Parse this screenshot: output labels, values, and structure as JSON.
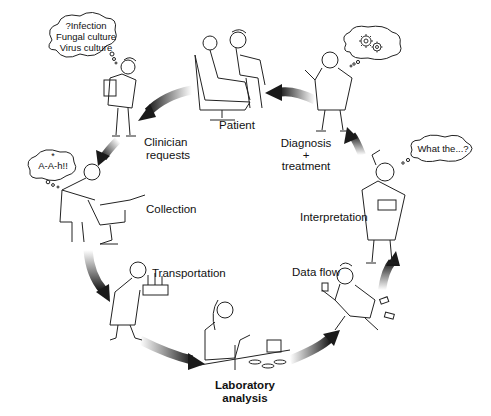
{
  "diagram": {
    "type": "cycle",
    "direction": "clockwise-from-patient-leftward",
    "stages": [
      {
        "id": "patient",
        "label": "Patient"
      },
      {
        "id": "clinician",
        "label_line1": "Clinician",
        "label_line2": "requests"
      },
      {
        "id": "collection",
        "label": "Collection"
      },
      {
        "id": "transportation",
        "label": "Transportation"
      },
      {
        "id": "laboratory",
        "label_line1": "Laboratory",
        "label_line2": "analysis"
      },
      {
        "id": "dataflow",
        "label": "Data flow"
      },
      {
        "id": "interpretation",
        "label": "Interpretation"
      },
      {
        "id": "diagnosis",
        "label_line1": "Diagnosis",
        "label_line2": "+",
        "label_line3": "treatment"
      }
    ],
    "thought_bubbles": {
      "clinician": {
        "line1": "?Infection",
        "line2": "Fungal culture",
        "line3": "Virus culture"
      },
      "collection": {
        "star": "*",
        "text": "A-A-h!!"
      },
      "interpretation": {
        "text": "What the...?"
      },
      "diagnosis": {
        "icon": "gears-icon"
      }
    },
    "arrow_color": "#2a2a2a"
  }
}
